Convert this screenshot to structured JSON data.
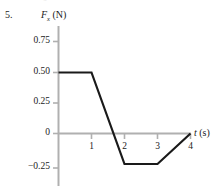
{
  "figure": {
    "problem_number": "5.",
    "clipped_header_text": "a.  v  g",
    "y_axis_label_main": "F",
    "y_axis_label_sub": "x",
    "y_axis_label_unit": "(N)",
    "x_axis_label_main": "t",
    "x_axis_label_unit": "(s)",
    "axis_color": "#b0b0b0",
    "curve_color": "#1a1a1a",
    "background_color": "#ffffff"
  },
  "chart_data": {
    "type": "line",
    "title": "",
    "xlabel": "t (s)",
    "ylabel": "F_x (N)",
    "xlim": [
      0,
      4.6
    ],
    "ylim": [
      -0.35,
      0.92
    ],
    "grid": false,
    "legend": null,
    "xticks": [
      1,
      2,
      3,
      4
    ],
    "xtick_labels": [
      "1",
      "2",
      "3",
      "4"
    ],
    "yticks": [
      0.75,
      0.5,
      0.25,
      0,
      -0.25
    ],
    "ytick_labels": [
      "0.75",
      "0.50",
      "0.25",
      "0",
      "−0.25"
    ],
    "series": [
      {
        "name": "F_x vs t",
        "x": [
          0,
          1,
          2,
          3,
          4
        ],
        "y": [
          0.5,
          0.5,
          -0.25,
          -0.25,
          0
        ]
      }
    ],
    "annotations": []
  }
}
